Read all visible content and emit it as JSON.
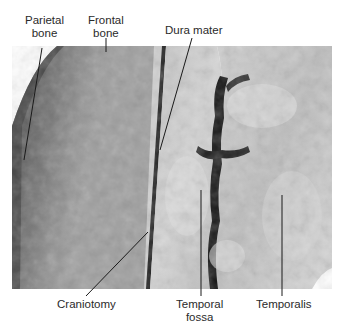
{
  "figure": {
    "labels": {
      "parietal_bone": {
        "line1": "Parietal",
        "line2": "bone"
      },
      "frontal_bone": {
        "line1": "Frontal",
        "line2": "bone"
      },
      "dura_mater": {
        "line1": "Dura mater"
      },
      "craniotomy": {
        "line1": "Craniotomy"
      },
      "temporal_fossa": {
        "line1": "Temporal",
        "line2": "fossa"
      },
      "temporalis": {
        "line1": "Temporalis"
      }
    },
    "colors": {
      "bone_dark": "#5f5f5f",
      "bone_mid": "#8a8a8a",
      "tissue_light": "#c9c9c9",
      "groove_dark": "#111111",
      "leader_line": "#1a1a1a"
    }
  }
}
